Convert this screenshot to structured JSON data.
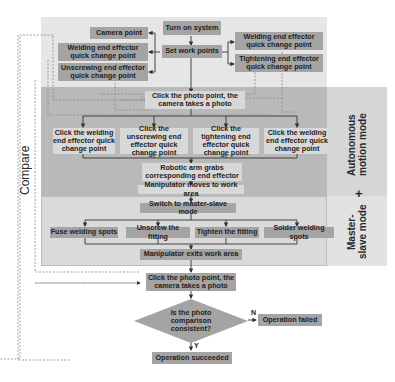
{
  "diagram": {
    "compare_label": "Compare",
    "mode_labels": {
      "autonomous": "Autonomous motion mode",
      "plus": "+",
      "master_slave": "Master-slave mode"
    },
    "setup": {
      "turn_on": "Turn on system",
      "set_work_points": "Set work points",
      "left_points": [
        "Camera point",
        "Welding end effector quick change point",
        "Unscrewing end effector quick change point"
      ],
      "right_points": [
        "Welding end effector quick change point",
        "Tightening end effector quick change point"
      ]
    },
    "autonomous": {
      "photo": "Click the photo point, the camera takes a photo",
      "click_points": [
        "Click the welding end effector quick change point",
        "Click the unscrewing end effector quick change point",
        "Click the tightening end effector quick change point",
        "Click the welding end effector quick change point"
      ],
      "grab": "Robotic arm grabs corresponding end effector",
      "move": "Manipulator moves to work area"
    },
    "master_slave": {
      "switch": "Switch to master-slave mode",
      "tasks": [
        "Fuse welding spots",
        "Unscrew the fitting",
        "Tighten the fitting",
        "Solder welding spots"
      ],
      "exit": "Manipulator exits work area"
    },
    "final": {
      "photo": "Click the photo point, the camera takes a photo",
      "decision": "Is the photo comparison consistent?",
      "no_label": "N",
      "yes_label": "Y",
      "failed": "Operation failed",
      "succeeded": "Operation succeeded"
    },
    "colors": {
      "setup_bg": "#e6e6e6",
      "autonomous_bg": "#b8b8b8",
      "master_bg": "#d9d9d9",
      "side_bg": "#dedede",
      "box_dark": "#a4a4a4",
      "box_light": "#cbcbcb"
    }
  }
}
